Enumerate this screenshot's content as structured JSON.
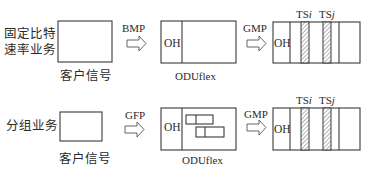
{
  "rows": [
    {
      "service_label_line1": "固定比特",
      "service_label_line2": "速率业务",
      "client_caption": "客户信号",
      "mapping1": "BMP",
      "oduflex_oh": "OH",
      "oduflex_caption": "ODUflex",
      "mapping2": "GMP",
      "frame_oh": "OH",
      "ts_i_prefix": "TS",
      "ts_i_index": "i",
      "ts_j_prefix": "TS",
      "ts_j_index": "j"
    },
    {
      "service_label_line1": "分组业务",
      "client_caption": "客户信号",
      "mapping1": "GFP",
      "oduflex_oh": "OH",
      "oduflex_caption": "ODUflex",
      "mapping2": "GMP",
      "frame_oh": "OH",
      "ts_i_prefix": "TS",
      "ts_i_index": "i",
      "ts_j_prefix": "TS",
      "ts_j_index": "j"
    }
  ]
}
